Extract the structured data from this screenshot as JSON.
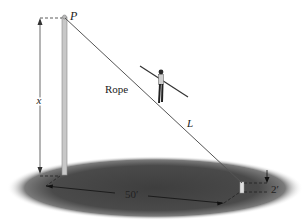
{
  "figure": {
    "labels": {
      "point": "P",
      "rope": "Rope",
      "length": "L",
      "height": "x",
      "distance": "50′",
      "short_pole_height": "2′"
    },
    "colors": {
      "ground_shadow": "#4a4a4a",
      "pole": "#c8c8c8",
      "rope": "#555555",
      "text": "#222222"
    }
  }
}
